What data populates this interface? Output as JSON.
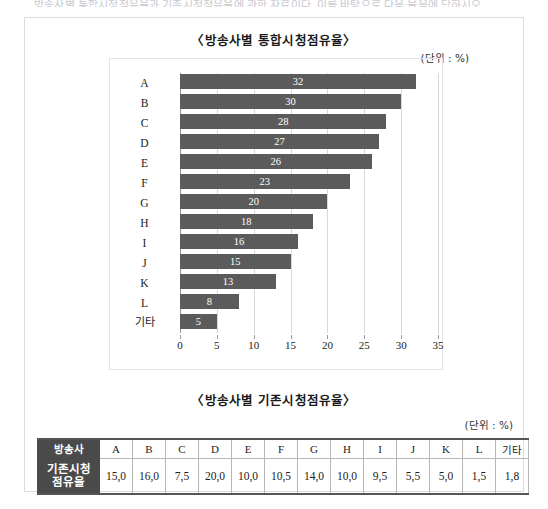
{
  "top_clip_text": "방송사별 통합시청점유율과 기존시청점유율에 관한 자료이다. 이를 바탕으로 다음 물음에 답하시오.",
  "chart_section": {
    "title": "〈방송사별 통합시청점유율〉",
    "unit_note": "(단위 : %)"
  },
  "table_section": {
    "title": "〈방송사별 기존시청점유율〉",
    "unit_note": "(단위 : %)",
    "row_header_labels": [
      "방송사",
      "기존시청\n점유율"
    ],
    "header_cells": [
      "방송사",
      "A",
      "B",
      "C",
      "D",
      "E",
      "F",
      "G",
      "H",
      "I",
      "J",
      "K",
      "L",
      "기타"
    ],
    "data_cells": [
      "기존시청 점유율",
      "15,0",
      "16,0",
      "7,5",
      "20,0",
      "10,0",
      "10,5",
      "14,0",
      "10,0",
      "9,5",
      "5,5",
      "5,0",
      "1,5",
      "1,8"
    ]
  },
  "colors": {
    "bar_fill": "#5b5b5b",
    "bar_value_text": "#ffffff",
    "table_header_bg": "#4a4a4a",
    "table_header_text": "#ffffff",
    "page_border": "#dcdcdc",
    "gridline": "#d8d8d8"
  },
  "chart_data": {
    "type": "bar",
    "orientation": "horizontal",
    "title": "〈방송사별 통합시청점유율〉",
    "xlabel": "",
    "ylabel": "",
    "unit": "%",
    "xlim": [
      0,
      35
    ],
    "xticks": [
      0,
      5,
      10,
      15,
      20,
      25,
      30,
      35
    ],
    "xtick_labels": [
      "0",
      "5",
      "10",
      "15",
      "20",
      "25",
      "30",
      "35"
    ],
    "grid": true,
    "legend": null,
    "categories": [
      "A",
      "B",
      "C",
      "D",
      "E",
      "F",
      "G",
      "H",
      "I",
      "J",
      "K",
      "L",
      "기타"
    ],
    "values": [
      32,
      30,
      28,
      27,
      26,
      23,
      20,
      18,
      16,
      15,
      13,
      8,
      5
    ],
    "data_labels": [
      "32",
      "30",
      "28",
      "27",
      "26",
      "23",
      "20",
      "18",
      "16",
      "15",
      "13",
      "8",
      "5"
    ],
    "series": [
      {
        "name": "통합시청점유율",
        "values": [
          32,
          30,
          28,
          27,
          26,
          23,
          20,
          18,
          16,
          15,
          13,
          8,
          5
        ]
      }
    ]
  },
  "table_data": {
    "type": "table",
    "title": "〈방송사별 기존시청점유율〉",
    "unit": "%",
    "columns": [
      "방송사",
      "A",
      "B",
      "C",
      "D",
      "E",
      "F",
      "G",
      "H",
      "I",
      "J",
      "K",
      "L",
      "기타"
    ],
    "rows": [
      {
        "label": "기존시청 점유율",
        "values": [
          "15,0",
          "16,0",
          "7,5",
          "20,0",
          "10,0",
          "10,5",
          "14,0",
          "10,0",
          "9,5",
          "5,5",
          "5,0",
          "1,5",
          "1,8"
        ],
        "numeric": [
          15.0,
          16.0,
          7.5,
          20.0,
          10.0,
          10.5,
          14.0,
          10.0,
          9.5,
          5.5,
          5.0,
          1.5,
          1.8
        ]
      }
    ]
  }
}
